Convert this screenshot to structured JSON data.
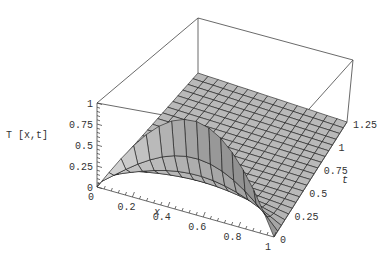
{
  "chart_data": {
    "type": "surface3d",
    "title": "",
    "function": "T[x,t] = Sin[Pi x] Exp[-Pi^2 t]",
    "xlabel": "x",
    "ylabel": "t",
    "zlabel": "T [x,t]",
    "x_range": [
      0,
      1
    ],
    "t_range": [
      0,
      1.25
    ],
    "z_range": [
      0,
      1
    ],
    "x_ticks": [
      "0",
      "0.2",
      "0.4",
      "0.6",
      "0.8",
      "1"
    ],
    "x_tick_values": [
      0,
      0.2,
      0.4,
      0.6,
      0.8,
      1
    ],
    "t_ticks": [
      "0",
      "0.25",
      "0.5",
      "0.75",
      "1",
      "1.25"
    ],
    "t_tick_values": [
      0,
      0.25,
      0.5,
      0.75,
      1,
      1.25
    ],
    "z_ticks": [
      "0",
      "0.25",
      "0.5",
      "0.75",
      "1"
    ],
    "z_tick_values": [
      0,
      0.25,
      0.5,
      0.75,
      1
    ],
    "mesh": {
      "x_cells": 15,
      "t_cells": 20
    },
    "boxed": true,
    "grid": false,
    "surface_color": "#b4b4b4",
    "mesh_color": "#1a1a1a"
  },
  "labels": {
    "x_axis": "x",
    "t_axis": "t",
    "z_axis": "T [x,t]"
  }
}
